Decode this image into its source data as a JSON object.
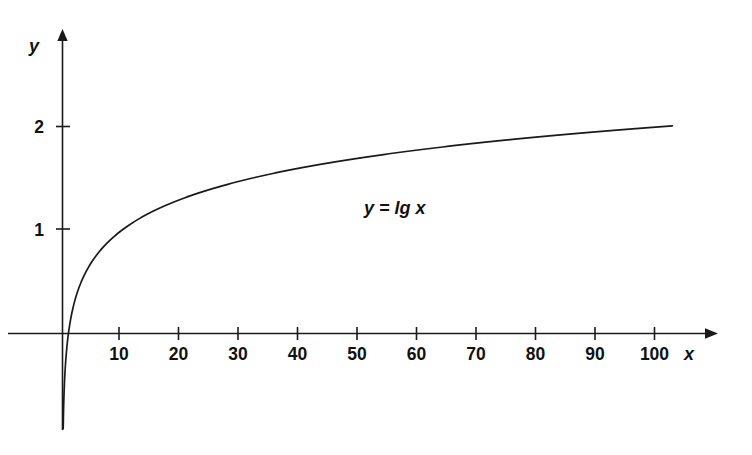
{
  "chart_data": {
    "type": "line",
    "title": "",
    "subtitle": "",
    "xlabel": "x",
    "ylabel": "y",
    "equation_label": "y = lg x",
    "function": "y = log10(x)",
    "grid": false,
    "legend": "none",
    "annotation_position": {
      "x": 42,
      "y": 1.32
    },
    "xlim": [
      -1.5,
      112
    ],
    "ylim": [
      -0.95,
      2.9
    ],
    "x_ticks": [
      10,
      20,
      30,
      40,
      50,
      60,
      70,
      80,
      90,
      100
    ],
    "x_tick_labels": [
      "10",
      "20",
      "30",
      "40",
      "50",
      "60",
      "70",
      "80",
      "90",
      "100"
    ],
    "y_ticks": [
      1,
      2
    ],
    "y_tick_labels": [
      "1",
      "2"
    ],
    "series": [
      {
        "name": "y = lg x",
        "color": "#1a1a1a",
        "x": [
          0.12,
          0.16,
          0.22,
          0.3,
          0.4,
          0.55,
          0.75,
          1,
          1.4,
          2,
          2.8,
          4,
          5.5,
          7.5,
          10,
          14,
          18,
          22,
          27,
          32,
          38,
          45,
          52,
          60,
          68,
          76,
          85,
          94,
          103
        ],
        "y": [
          -0.921,
          -0.796,
          -0.658,
          -0.523,
          -0.398,
          -0.26,
          -0.125,
          0,
          0.146,
          0.301,
          0.447,
          0.602,
          0.74,
          0.875,
          1.0,
          1.146,
          1.255,
          1.342,
          1.431,
          1.505,
          1.58,
          1.653,
          1.716,
          1.778,
          1.833,
          1.881,
          1.929,
          1.973,
          2.013
        ]
      }
    ]
  },
  "axes": {
    "y_axis_name": "y",
    "x_axis_name": "x"
  }
}
